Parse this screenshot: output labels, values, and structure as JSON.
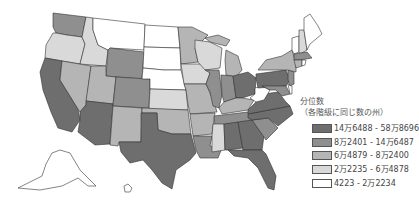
{
  "legend": {
    "title_line1": "分位数",
    "title_line2": "（各階級に同じ数の州）",
    "items": [
      {
        "label": "14万6488 - 58万8696",
        "color": "#6e6e6e"
      },
      {
        "label": "8万2401 - 14万6487",
        "color": "#8f8f8f"
      },
      {
        "label": "6万4879 - 8万2400",
        "color": "#b5b5b5"
      },
      {
        "label": "2万2235 - 6万4878",
        "color": "#d9d9d9"
      },
      {
        "label": "4223 - 2万2234",
        "color": "#ffffff"
      }
    ]
  },
  "states": {
    "WA": 1,
    "OR": 3,
    "CA": 0,
    "ID": 3,
    "NV": 2,
    "MT": 4,
    "WY": 1,
    "UT": 2,
    "AZ": 0,
    "CO": 1,
    "NM": 2,
    "ND": 4,
    "SD": 4,
    "NE": 4,
    "KS": 3,
    "OK": 2,
    "TX": 0,
    "MN": 2,
    "IA": 3,
    "MO": 2,
    "AR": 2,
    "LA": 1,
    "WI": 3,
    "IL": 1,
    "MI": 2,
    "IN": 1,
    "OH": 0,
    "KY": 2,
    "TN": 1,
    "MS": 3,
    "AL": 0,
    "GA": 0,
    "FL": 0,
    "SC": 1,
    "NC": 0,
    "VA": 0,
    "WV": 4,
    "PA": 0,
    "NY": 2,
    "VT": 4,
    "NH": 3,
    "ME": 4,
    "MA": 1,
    "CT": 2,
    "RI": 4,
    "NJ": 1,
    "DE": 4,
    "MD": 1,
    "AK": 4,
    "HI": 4
  }
}
